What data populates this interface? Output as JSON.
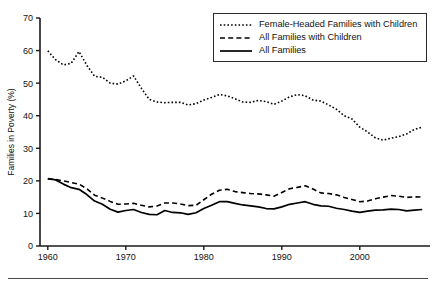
{
  "chart_data": {
    "type": "line",
    "title": "",
    "xlabel": "",
    "ylabel": "Families in Poverty (%)",
    "xlim": [
      1959,
      2009
    ],
    "ylim": [
      0,
      70
    ],
    "xticks": [
      1960,
      1970,
      1980,
      1990,
      2000
    ],
    "yticks": [
      0,
      10,
      20,
      30,
      40,
      50,
      60,
      70
    ],
    "grid": false,
    "legend_position": "top-right",
    "x": [
      1960,
      1961,
      1962,
      1963,
      1964,
      1965,
      1966,
      1967,
      1968,
      1969,
      1970,
      1971,
      1972,
      1973,
      1974,
      1975,
      1976,
      1977,
      1978,
      1979,
      1980,
      1981,
      1982,
      1983,
      1984,
      1985,
      1986,
      1987,
      1988,
      1989,
      1990,
      1991,
      1992,
      1993,
      1994,
      1995,
      1996,
      1997,
      1998,
      1999,
      2000,
      2001,
      2002,
      2003,
      2004,
      2005,
      2006,
      2007,
      2008
    ],
    "series": [
      {
        "name": "Female-Headed Families with Children",
        "style": "dotted",
        "values": [
          59.9,
          57.2,
          55.6,
          56.1,
          59.7,
          55.5,
          52.1,
          51.8,
          50.0,
          49.7,
          50.7,
          52.2,
          48.4,
          45.0,
          44.2,
          44.0,
          44.1,
          44.1,
          43.3,
          43.7,
          44.8,
          45.6,
          46.5,
          46.1,
          45.2,
          44.2,
          44.1,
          44.7,
          44.3,
          43.5,
          44.5,
          45.8,
          46.5,
          46.1,
          44.8,
          44.5,
          43.3,
          42.0,
          40.0,
          39.0,
          36.5,
          35.0,
          33.2,
          32.5,
          33.1,
          33.6,
          34.4,
          35.8,
          36.5
        ]
      },
      {
        "name": "All Families with Children",
        "style": "dashed",
        "values": [
          20.6,
          20.4,
          20.0,
          19.5,
          19.0,
          17.6,
          15.6,
          14.7,
          13.7,
          12.8,
          12.9,
          13.1,
          12.5,
          12.0,
          12.3,
          13.2,
          13.2,
          12.9,
          12.4,
          12.5,
          14.2,
          15.9,
          17.1,
          17.4,
          16.7,
          16.4,
          16.1,
          16.0,
          15.7,
          15.3,
          16.4,
          17.6,
          18.0,
          18.5,
          17.5,
          16.3,
          16.1,
          15.7,
          14.9,
          14.3,
          13.6,
          13.8,
          14.5,
          15.0,
          15.5,
          15.3,
          14.9,
          15.1,
          15.0
        ]
      },
      {
        "name": "All Families",
        "style": "solid",
        "values": [
          20.7,
          20.3,
          19.0,
          17.9,
          17.4,
          15.8,
          13.8,
          12.8,
          11.3,
          10.4,
          10.9,
          11.2,
          10.3,
          9.7,
          9.6,
          10.9,
          10.3,
          10.2,
          9.7,
          10.2,
          11.5,
          12.5,
          13.6,
          13.6,
          13.1,
          12.6,
          12.3,
          12.0,
          11.5,
          11.4,
          12.0,
          12.8,
          13.2,
          13.6,
          12.8,
          12.3,
          12.2,
          11.6,
          11.2,
          10.7,
          10.3,
          10.7,
          11.0,
          11.1,
          11.3,
          11.2,
          10.8,
          11.0,
          11.2
        ]
      }
    ]
  },
  "legend": {
    "items": [
      {
        "label": "Female-Headed Families with Children",
        "style": "dotted"
      },
      {
        "label": "All Families with Children",
        "style": "dashed"
      },
      {
        "label": "All Families",
        "style": "solid"
      }
    ]
  },
  "caption": {
    "text": ""
  },
  "colors": {
    "line": "#000000",
    "axis": "#1a1a1a",
    "text": "#111111"
  }
}
